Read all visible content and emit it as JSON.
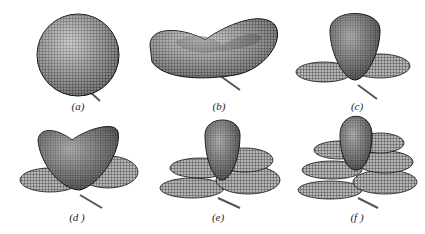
{
  "figure": {
    "panels": [
      {
        "id": "a",
        "label": "(a)",
        "shape": "sphere"
      },
      {
        "id": "b",
        "label": "(b)",
        "shape": "saddle-torus"
      },
      {
        "id": "c",
        "label": "(c)",
        "shape": "vertical-lobe-with-ring"
      },
      {
        "id": "d",
        "label": "(d )",
        "shape": "saddle-with-ring"
      },
      {
        "id": "e",
        "label": "(e)",
        "shape": "vertical-lobe-with-two-rings"
      },
      {
        "id": "f",
        "label": "(f )",
        "shape": "vertical-lobe-with-three-rings"
      }
    ],
    "colors": {
      "mesh": "#1a1a1a",
      "fill": "#9a9a9a",
      "axis": "#555555",
      "background": "#ffffff"
    }
  }
}
